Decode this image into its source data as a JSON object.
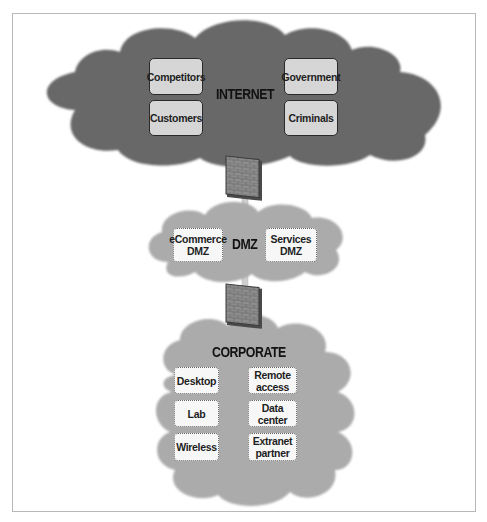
{
  "diagram": {
    "internet": {
      "label": "INTERNET",
      "color": "#666666",
      "nodes": [
        "Competitors",
        "Customers",
        "Government",
        "Criminals"
      ]
    },
    "dmz": {
      "label": "DMZ",
      "color": "#aaaaaa",
      "nodes": [
        {
          "line1": "eCommerce",
          "line2": "DMZ"
        },
        {
          "line1": "Services",
          "line2": "DMZ"
        }
      ]
    },
    "corporate": {
      "label": "CORPORATE",
      "color": "#aaaaaa",
      "nodes": [
        {
          "line1": "Desktop",
          "line2": ""
        },
        {
          "line1": "Remote",
          "line2": "access"
        },
        {
          "line1": "Lab",
          "line2": ""
        },
        {
          "line1": "Data",
          "line2": "center"
        },
        {
          "line1": "Wireless",
          "line2": ""
        },
        {
          "line1": "Extranet",
          "line2": "partner"
        }
      ]
    },
    "firewalls": [
      "firewall-internet-dmz",
      "firewall-dmz-corporate"
    ]
  }
}
